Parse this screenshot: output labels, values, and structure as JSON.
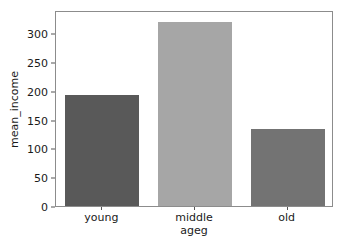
{
  "chart_data": {
    "type": "bar",
    "title": "",
    "xlabel": "ageg",
    "ylabel": "mean_income",
    "categories": [
      "young",
      "middle",
      "old"
    ],
    "values": [
      193,
      320,
      134
    ],
    "bar_colors": [
      "#595959",
      "#a6a6a6",
      "#737373"
    ],
    "ylim": [
      0,
      340
    ],
    "yticks": [
      0,
      50,
      100,
      150,
      200,
      250,
      300
    ],
    "ytick_labels": [
      "0",
      "50",
      "100",
      "150",
      "200",
      "250",
      "300"
    ],
    "xtick_labels": [
      "young",
      "middle",
      "old"
    ],
    "grid": false,
    "legend": null,
    "series": [
      {
        "name": "mean_income",
        "values": [
          193,
          320,
          134
        ]
      }
    ]
  },
  "figure": {
    "background_color": "#ffffff",
    "frame_color": "#8c8c8c",
    "tick_color": "#555555",
    "text_color": "#1a1a1a"
  }
}
